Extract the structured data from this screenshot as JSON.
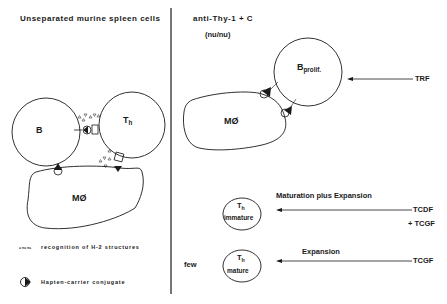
{
  "left_panel": {
    "title": "Unseparated murine spleen cells",
    "cells": {
      "b_cell": "B",
      "th_cell_main": "T",
      "th_cell_sub": "h",
      "macrophage": "MØ"
    },
    "legend": {
      "recognition_symbol": "▵▿▵▿▵",
      "recognition_text": "recognition of H-2 structures",
      "conjugate_text": "Hapten-carrier conjugate"
    }
  },
  "right_panel": {
    "title": "anti-Thy-1 + C",
    "subtitle": "(nu/nu)",
    "cells": {
      "b_prolif_main": "B",
      "b_prolif_sub": "prolif.",
      "macrophage": "MØ",
      "th_immature_main": "T",
      "th_immature_sub": "h",
      "th_immature_label": "immature",
      "th_mature_main": "T",
      "th_mature_sub": "h",
      "th_mature_label": "mature"
    },
    "few_label": "few",
    "factors": {
      "trf": "TRF",
      "tcdf": "TCDF",
      "tcgf_plus": "+ TCGF",
      "tcgf": "TCGF"
    },
    "process_labels": {
      "maturation": "Maturation plus Expansion",
      "expansion": "Expansion"
    }
  },
  "colors": {
    "ink": "#1a1a1a",
    "background": "#ffffff"
  }
}
